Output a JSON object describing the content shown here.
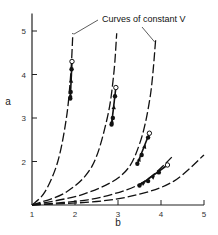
{
  "chart_data": {
    "type": "line",
    "title": "",
    "xlabel": "b",
    "ylabel": "a",
    "xlim": [
      1,
      5
    ],
    "ylim": [
      1,
      5.4
    ],
    "x_ticks": [
      1,
      2,
      3,
      4,
      5
    ],
    "y_ticks": [
      2,
      3,
      4,
      5
    ],
    "x_tick_labels": [
      "1",
      "2",
      "3",
      "4",
      "5"
    ],
    "y_tick_labels": [
      "2",
      "3",
      "4",
      "5"
    ],
    "grid": false,
    "legend": null,
    "annotation": {
      "text": "Curves of constant V",
      "pointer_targets": [
        [
          1.95,
          4.95
        ],
        [
          3.85,
          4.75
        ]
      ]
    },
    "series": [
      {
        "name": "constant V curve 1",
        "style": "dashed",
        "x": [
          1.0,
          1.3,
          1.6,
          1.8,
          1.9,
          1.95
        ],
        "y": [
          1.0,
          1.3,
          2.0,
          3.0,
          4.0,
          4.95
        ]
      },
      {
        "name": "constant V curve 2",
        "style": "dashed",
        "x": [
          1.0,
          1.8,
          2.4,
          2.75,
          2.9,
          2.97
        ],
        "y": [
          1.0,
          1.3,
          1.9,
          3.0,
          4.0,
          4.95
        ]
      },
      {
        "name": "constant V curve 3",
        "style": "dashed",
        "x": [
          1.0,
          2.2,
          3.1,
          3.5,
          3.75,
          3.88
        ],
        "y": [
          1.0,
          1.25,
          1.7,
          2.4,
          3.5,
          4.85
        ]
      },
      {
        "name": "constant V curve 4",
        "style": "dashed",
        "x": [
          1.0,
          2.3,
          3.2,
          3.7,
          4.1,
          4.25
        ],
        "y": [
          1.0,
          1.12,
          1.35,
          1.6,
          1.95,
          2.1
        ]
      },
      {
        "name": "constant V curve 5",
        "style": "dashed",
        "x": [
          1.0,
          2.5,
          3.5,
          4.3,
          5.0
        ],
        "y": [
          1.0,
          1.08,
          1.25,
          1.55,
          2.15
        ]
      }
    ],
    "trajectories": [
      {
        "curve": 1,
        "open_point": [
          1.93,
          4.3
        ],
        "filled_points": [
          [
            1.92,
            4.12
          ],
          [
            1.9,
            3.6
          ],
          [
            1.89,
            3.45
          ]
        ],
        "arrow_direction": "up"
      },
      {
        "curve": 2,
        "open_point": [
          2.95,
          3.7
        ],
        "filled_points": [
          [
            2.93,
            3.5
          ],
          [
            2.88,
            3.0
          ],
          [
            2.85,
            2.85
          ]
        ],
        "arrow_direction": "up"
      },
      {
        "curve": 3,
        "open_point": [
          3.73,
          2.65
        ],
        "filled_points": [
          [
            3.7,
            2.55
          ],
          [
            3.55,
            2.15
          ],
          [
            3.45,
            1.95
          ]
        ],
        "arrow_direction": "up"
      },
      {
        "curve": 4,
        "open_point": [
          4.15,
          1.92
        ],
        "filled_points": [
          [
            3.95,
            1.75
          ],
          [
            3.7,
            1.55
          ],
          [
            3.5,
            1.45
          ]
        ],
        "arrow_direction": "up"
      }
    ]
  }
}
